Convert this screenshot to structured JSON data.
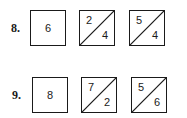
{
  "problems": [
    {
      "label": "8.",
      "whole": "6",
      "splits": [
        {
          "top": "2",
          "bottom": "4"
        },
        {
          "top": "5",
          "bottom": "4"
        }
      ]
    },
    {
      "label": "9.",
      "whole": "8",
      "splits": [
        {
          "top": "7",
          "bottom": "2"
        },
        {
          "top": "5",
          "bottom": "6"
        }
      ]
    }
  ]
}
